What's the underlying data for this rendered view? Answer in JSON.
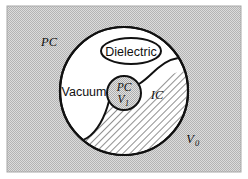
{
  "figure": {
    "kind": "set-diagram",
    "background_panel": {
      "fill_color": "#c9c9c9",
      "border_color": "#9a9a9a",
      "x": 7,
      "y": 6,
      "width": 234,
      "height": 166
    },
    "outer_region": {
      "name": "outer-universe",
      "label": "PC",
      "label_style": "serif-italic",
      "label_x": 49,
      "label_y": 45
    },
    "outer_region_volume": {
      "name": "outer-volume",
      "label": "V",
      "subscript": "0",
      "label_style": "serif-italic",
      "label_x": 188,
      "label_y": 141
    },
    "main_circle": {
      "name": "main-boundary-circle",
      "cx": 124,
      "cy": 91,
      "r": 64,
      "fill_color": "#ffffff",
      "stroke_color": "#111111",
      "stroke_width": 2.2
    },
    "vacuum_region": {
      "name": "vacuum-region",
      "label": "Vacuum",
      "label_style": "sans",
      "label_x": 84,
      "label_y": 95,
      "fill_color": "#ffffff"
    },
    "dielectric_region": {
      "name": "dielectric-ellipse",
      "label": "Dielectric",
      "label_style": "sans",
      "cx": 131,
      "cy": 51,
      "rx": 30,
      "ry": 13,
      "fill_color": "#ffffff",
      "stroke_color": "#111111",
      "stroke_width": 2.0
    },
    "ic_region": {
      "name": "ic-region",
      "label": "IC",
      "label_style": "serif-italic",
      "label_x": 157,
      "label_y": 97,
      "hatch_color": "#3a3a3a",
      "hatch_bg": "#ffffff",
      "hatch_angle_deg": 45
    },
    "inner_circle": {
      "name": "inner-pc-circle",
      "cx": 124,
      "cy": 93,
      "r": 17,
      "fill_color": "#c9c9c9",
      "stroke_color": "#111111",
      "stroke_width": 2.0,
      "label_top": "PC",
      "label_bottom": "V",
      "label_bottom_subscript": "1",
      "label_style": "serif-italic"
    }
  }
}
